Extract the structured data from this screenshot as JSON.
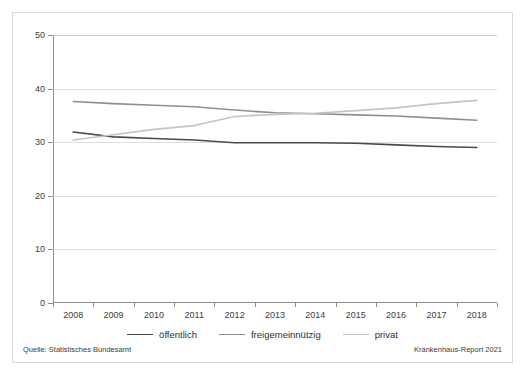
{
  "chart_data": {
    "type": "line",
    "title": "",
    "subtitle": "",
    "xlabel": "",
    "ylabel": "",
    "grid": true,
    "legend_position": "bottom",
    "categories": [
      "2008",
      "2009",
      "2010",
      "2011",
      "2012",
      "2013",
      "2014",
      "2015",
      "2016",
      "2017",
      "2018"
    ],
    "x": [
      2008,
      2009,
      2010,
      2011,
      2012,
      2013,
      2014,
      2015,
      2016,
      2017,
      2018
    ],
    "xlim": [
      2007.5,
      2018.5
    ],
    "ylim": [
      0,
      50
    ],
    "yticks": [
      0,
      10,
      20,
      30,
      40,
      50
    ],
    "series": [
      {
        "name": "öffentlich",
        "color": "#4a4a4a",
        "values": [
          31.9,
          31.0,
          30.7,
          30.4,
          29.9,
          29.9,
          29.9,
          29.8,
          29.5,
          29.2,
          29.0
        ]
      },
      {
        "name": "freigemeinnützig",
        "color": "#8f8f8f",
        "values": [
          37.6,
          37.2,
          36.9,
          36.6,
          36.0,
          35.5,
          35.3,
          35.1,
          34.9,
          34.5,
          34.1
        ]
      },
      {
        "name": "privat",
        "color": "#c4c4c4",
        "values": [
          30.4,
          31.4,
          32.4,
          33.1,
          34.8,
          35.2,
          35.4,
          35.9,
          36.4,
          37.2,
          37.8
        ]
      }
    ]
  },
  "axes": {
    "y_tick_labels": [
      "0",
      "10",
      "20",
      "30",
      "40",
      "50"
    ],
    "x_tick_labels": [
      "2008",
      "2009",
      "2010",
      "2011",
      "2012",
      "2013",
      "2014",
      "2015",
      "2016",
      "2017",
      "2018"
    ]
  },
  "legend": {
    "items": [
      {
        "label": "öffentlich",
        "color": "#4a4a4a"
      },
      {
        "label": "freigemeinnützig",
        "color": "#8f8f8f"
      },
      {
        "label": "privat",
        "color": "#c4c4c4"
      }
    ]
  },
  "footer": {
    "source": "Quelle: Statistisches Bundesamt",
    "credit": "Krankenhaus-Report 2021"
  },
  "colors": {
    "frame": "#d9d9d9",
    "axis": "#8c8c8c",
    "grid": "#dedede",
    "text": "#3d3d3d",
    "background": "#ffffff"
  }
}
